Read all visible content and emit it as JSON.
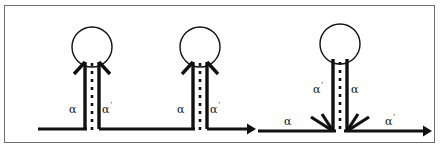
{
  "figure": {
    "title": "",
    "type": "diagram",
    "domain": "nucleic-acid-secondary-structure",
    "canvas": {
      "width": 440,
      "height": 150,
      "background": "#ffffff"
    },
    "frame": {
      "stroke": "#6e6e6e",
      "stroke_width": 1,
      "x": 4,
      "y": 5,
      "width": 431,
      "height": 138
    },
    "style": {
      "strand_color": "#111111",
      "strand_width": 3.2,
      "loop_stroke": "#111111",
      "loop_width": 1.2,
      "pair_color": "#111111",
      "pair_dash": "3 5",
      "pair_width": 2.6
    },
    "motifs": [
      {
        "id": "hairpin-1",
        "name": "hairpin-left",
        "loop": {
          "cx": 92,
          "cy": 47,
          "r": 20
        },
        "stem": {
          "left_x": 85,
          "right_x": 99,
          "top_y": 63,
          "bottom_y": 129
        },
        "pair_line": {
          "x": 92,
          "top_y": 63,
          "bottom_y": 130
        },
        "labels": [
          {
            "name": "label-alpha-left",
            "text": "α",
            "prime": "",
            "x": 73,
            "y": 110
          },
          {
            "name": "label-alpha-prime-right",
            "text": "α",
            "prime": "‘",
            "x": 104,
            "y": 110
          }
        ],
        "arrowheads": [
          {
            "name": "arrowhead-stem-left",
            "x": 85,
            "y": 63,
            "dir": "up-left"
          },
          {
            "name": "arrowhead-stem-right",
            "x": 99,
            "y": 63,
            "dir": "up-right"
          }
        ],
        "baseline": {
          "x1": 38,
          "x2": 85,
          "y": 129
        }
      },
      {
        "id": "hairpin-2",
        "name": "hairpin-middle",
        "loop": {
          "cx": 200,
          "cy": 47,
          "r": 20
        },
        "stem": {
          "left_x": 193,
          "right_x": 207,
          "top_y": 63,
          "bottom_y": 129
        },
        "pair_line": {
          "x": 200,
          "top_y": 63,
          "bottom_y": 130
        },
        "labels": [
          {
            "name": "label-alpha-left",
            "text": "α",
            "prime": "",
            "x": 181,
            "y": 110
          },
          {
            "name": "label-alpha-prime-right",
            "text": "α",
            "prime": "‘",
            "x": 212,
            "y": 110
          }
        ],
        "arrowheads": [
          {
            "name": "arrowhead-stem-left",
            "x": 193,
            "y": 63,
            "dir": "up-left"
          },
          {
            "name": "arrowhead-stem-right",
            "x": 207,
            "y": 63,
            "dir": "up-right"
          }
        ],
        "baseline": {
          "x1": 99,
          "x2": 193,
          "y": 129
        }
      },
      {
        "id": "hairpin-3",
        "name": "hairpin-right-junction",
        "loop": {
          "cx": 340,
          "cy": 44,
          "r": 20
        },
        "stem": {
          "left_x": 333,
          "right_x": 347,
          "top_y": 60,
          "bottom_y": 131
        },
        "pair_line": {
          "x": 340,
          "top_y": 60,
          "bottom_y": 132
        },
        "labels": [
          {
            "name": "label-alpha-prime-stem-left",
            "text": "α",
            "prime": "‘",
            "x": 317,
            "y": 90
          },
          {
            "name": "label-alpha-stem-right",
            "text": "α",
            "prime": "",
            "x": 352,
            "y": 90
          },
          {
            "name": "label-alpha-baseline-left",
            "text": "α",
            "prime": "",
            "x": 288,
            "y": 122
          },
          {
            "name": "label-alpha-prime-baseline-right",
            "text": "α",
            "prime": "‘",
            "x": 388,
            "y": 122
          }
        ],
        "junction_arrows": [
          {
            "name": "junction-arrow-inner-left",
            "x": 333,
            "y": 131,
            "dir": "down-right"
          },
          {
            "name": "junction-arrow-outer-left",
            "x": 333,
            "y": 131,
            "dir": "down-right-outer"
          },
          {
            "name": "junction-arrow-inner-right",
            "x": 347,
            "y": 131,
            "dir": "down-left"
          },
          {
            "name": "junction-arrow-outer-right",
            "x": 347,
            "y": 131,
            "dir": "down-left-outer"
          }
        ],
        "baseline_left": {
          "x1": 258,
          "x2": 333,
          "y": 131
        },
        "baseline_right": {
          "x1": 347,
          "x2": 425,
          "y": 131
        }
      }
    ],
    "terminal_arrows": [
      {
        "name": "strand-1-terminal-arrow",
        "x": 252,
        "y": 129,
        "direction": "right"
      },
      {
        "name": "strand-2-terminal-arrow",
        "x": 428,
        "y": 131,
        "direction": "right"
      }
    ],
    "legend_note": ""
  }
}
